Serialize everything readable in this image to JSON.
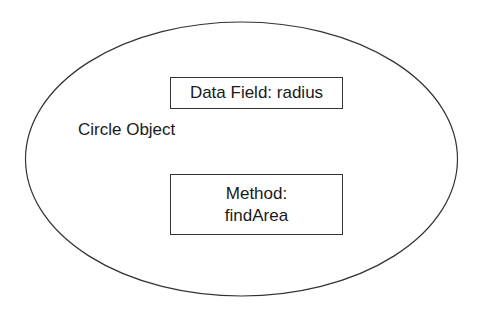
{
  "diagram": {
    "object_label": "Circle Object",
    "data_field": {
      "label": "Data Field: radius"
    },
    "method": {
      "line1": "Method:",
      "line2": "findArea"
    },
    "colors": {
      "stroke": "#333333",
      "text": "#1a1a1a",
      "background": "#ffffff"
    }
  }
}
